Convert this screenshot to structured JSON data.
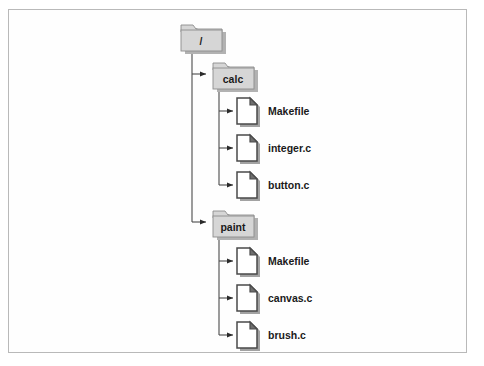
{
  "figure": {
    "border_color": "#b9b9b9",
    "background_color": "#ffffff"
  },
  "style": {
    "folder_fill": "#d4d4d4",
    "folder_stroke": "#8a8a8a",
    "folder_shadow": "#b0b0b0",
    "file_fill": "#ffffff",
    "file_stroke": "#4a4a4a",
    "file_shadow": "#9a9a9a",
    "connector_color": "#4a4a4a",
    "label_color": "#1a1a1a"
  },
  "tree": {
    "root": {
      "label": "/",
      "icon": "folder-icon",
      "x": 178,
      "y": 24,
      "children": [
        {
          "label": "calc",
          "icon": "folder-icon",
          "x": 210,
          "y": 62,
          "children": [
            {
              "label": "Makefile",
              "icon": "file-icon",
              "x": 236,
              "y": 97
            },
            {
              "label": "integer.c",
              "icon": "file-icon",
              "x": 236,
              "y": 134
            },
            {
              "label": "button.c",
              "icon": "file-icon",
              "x": 236,
              "y": 171
            }
          ]
        },
        {
          "label": "paint",
          "icon": "folder-icon",
          "x": 210,
          "y": 210,
          "children": [
            {
              "label": "Makefile",
              "icon": "file-icon",
              "x": 236,
              "y": 247
            },
            {
              "label": "canvas.c",
              "icon": "file-icon",
              "x": 236,
              "y": 284
            },
            {
              "label": "brush.c",
              "icon": "file-icon",
              "x": 236,
              "y": 321
            }
          ]
        }
      ]
    }
  },
  "labels": {
    "root": "/",
    "calc": "calc",
    "calc_file_1": "Makefile",
    "calc_file_2": "integer.c",
    "calc_file_3": "button.c",
    "paint": "paint",
    "paint_file_1": "Makefile",
    "paint_file_2": "canvas.c",
    "paint_file_3": "brush.c"
  }
}
